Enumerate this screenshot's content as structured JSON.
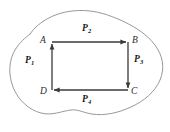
{
  "figure": {
    "type": "vector-field-circulation-diagram",
    "background_color": "#ffffff",
    "region": {
      "name": "outer-boundary-blob",
      "stroke_color": "#8c8c8c",
      "stroke_width": 0.9,
      "description": "irregular closed curve enclosing the rectangle"
    },
    "rectangle": {
      "stroke_color": "#3a3a3a",
      "stroke_width": 1.3,
      "corners": {
        "A": {
          "x": 52,
          "y": 42
        },
        "B": {
          "x": 128,
          "y": 42
        },
        "C": {
          "x": 128,
          "y": 90
        },
        "D": {
          "x": 52,
          "y": 90
        }
      },
      "circulation": "counterclockwise"
    },
    "vertices": [
      {
        "id": "vertex-a",
        "label": "A",
        "x": 41,
        "y": 37
      },
      {
        "id": "vertex-b",
        "label": "B",
        "x": 133,
        "y": 37
      },
      {
        "id": "vertex-c",
        "label": "C",
        "x": 132,
        "y": 88
      },
      {
        "id": "vertex-d",
        "label": "D",
        "x": 41,
        "y": 88
      }
    ],
    "edges": [
      {
        "id": "edge-ab",
        "from": "A",
        "to": "B",
        "direction": "right",
        "label": "P",
        "subscript": "2"
      },
      {
        "id": "edge-bc",
        "from": "B",
        "to": "C",
        "direction": "down",
        "label": "P",
        "subscript": "3"
      },
      {
        "id": "edge-cd",
        "from": "C",
        "to": "D",
        "direction": "left",
        "label": "P",
        "subscript": "4"
      },
      {
        "id": "edge-da",
        "from": "D",
        "to": "A",
        "direction": "up",
        "label": "P",
        "subscript": "1"
      }
    ],
    "path_labels": [
      {
        "id": "path-label-p1",
        "base": "P",
        "subscript": "1",
        "x": 28,
        "y": 60
      },
      {
        "id": "path-label-p2",
        "base": "P",
        "subscript": "2",
        "x": 85,
        "y": 27
      },
      {
        "id": "path-label-p3",
        "base": "P",
        "subscript": "3",
        "x": 136,
        "y": 59
      },
      {
        "id": "path-label-p4",
        "base": "P",
        "subscript": "4",
        "x": 85,
        "y": 98
      }
    ]
  }
}
